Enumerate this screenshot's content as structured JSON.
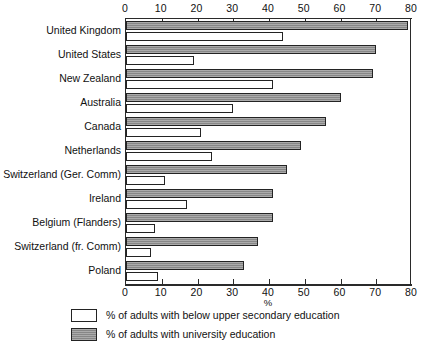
{
  "chart_data": {
    "type": "bar",
    "orientation": "horizontal",
    "title": "",
    "xlabel": "%",
    "ylabel": "",
    "xlim": [
      0,
      80
    ],
    "xticks": [
      0,
      10,
      20,
      30,
      40,
      50,
      60,
      70,
      80
    ],
    "grid": false,
    "legend_position": "bottom-left",
    "categories": [
      "United Kingdom",
      "United States",
      "New Zealand",
      "Australia",
      "Canada",
      "Netherlands",
      "Switzerland  (Ger. Comm)",
      "Ireland",
      "Belgium (Flanders)",
      "Switzerland (fr. Comm)",
      "Poland"
    ],
    "series": [
      {
        "name": "% of adults with university education",
        "key": "grey",
        "color": "#8e8e8e",
        "values": [
          79,
          70,
          69,
          60,
          56,
          49,
          45,
          41,
          41,
          37,
          33
        ]
      },
      {
        "name": "% of adults with below upper secondary education",
        "key": "white",
        "color": "#ffffff",
        "values": [
          44,
          19,
          41,
          30,
          21,
          24,
          11,
          17,
          8,
          7,
          9
        ]
      }
    ]
  },
  "legend": {
    "items": [
      {
        "swatch": "white",
        "label": "% of adults with below upper secondary education"
      },
      {
        "swatch": "grey",
        "label": "% of adults with university education"
      }
    ]
  }
}
